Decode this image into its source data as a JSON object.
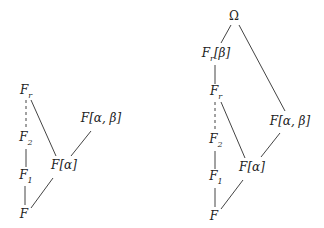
{
  "diagrams": [
    {
      "name": "left-lattice",
      "nodes": [
        {
          "id": "Fr",
          "base": "F",
          "sub": "r",
          "suffix": "",
          "x": 26,
          "y": 92
        },
        {
          "id": "F2",
          "base": "F",
          "sub": "2",
          "suffix": "",
          "x": 26,
          "y": 139
        },
        {
          "id": "F1",
          "base": "F",
          "sub": "1",
          "suffix": "",
          "x": 26,
          "y": 177
        },
        {
          "id": "F",
          "base": "F",
          "sub": "",
          "suffix": "",
          "x": 24,
          "y": 214
        },
        {
          "id": "Fa",
          "base": "F",
          "sub": "",
          "suffix": "[α]",
          "x": 64,
          "y": 165
        },
        {
          "id": "Fab",
          "base": "F",
          "sub": "",
          "suffix": "[α, β]",
          "x": 101,
          "y": 118
        }
      ],
      "edges": [
        {
          "from": "Fr",
          "to": "F2",
          "style": "dashed"
        },
        {
          "from": "F2",
          "to": "F1",
          "style": "solid"
        },
        {
          "from": "F1",
          "to": "F",
          "style": "solid"
        },
        {
          "from": "Fr",
          "to": "Fa",
          "style": "solid"
        },
        {
          "from": "F",
          "to": "Fa",
          "style": "solid"
        },
        {
          "from": "Fa",
          "to": "Fab",
          "style": "solid"
        }
      ]
    },
    {
      "name": "right-lattice",
      "nodes": [
        {
          "id": "Omega",
          "base": "Ω",
          "sub": "",
          "suffix": "",
          "x": 234,
          "y": 16
        },
        {
          "id": "Frb",
          "base": "F",
          "sub": "r",
          "suffix": "[β]",
          "x": 216,
          "y": 55
        },
        {
          "id": "Fr",
          "base": "F",
          "sub": "r",
          "suffix": "",
          "x": 216,
          "y": 93
        },
        {
          "id": "F2",
          "base": "F",
          "sub": "2",
          "suffix": "",
          "x": 216,
          "y": 141
        },
        {
          "id": "F1",
          "base": "F",
          "sub": "1",
          "suffix": "",
          "x": 216,
          "y": 178
        },
        {
          "id": "F",
          "base": "F",
          "sub": "",
          "suffix": "",
          "x": 214,
          "y": 216
        },
        {
          "id": "Fa",
          "base": "F",
          "sub": "",
          "suffix": "[α]",
          "x": 252,
          "y": 167
        },
        {
          "id": "Fab",
          "base": "F",
          "sub": "",
          "suffix": "[α, β]",
          "x": 290,
          "y": 121
        }
      ],
      "edges": [
        {
          "from": "Omega",
          "to": "Frb",
          "style": "solid"
        },
        {
          "from": "Omega",
          "to": "Fab",
          "style": "solid"
        },
        {
          "from": "Frb",
          "to": "Fr",
          "style": "solid"
        },
        {
          "from": "Fr",
          "to": "F2",
          "style": "dashed"
        },
        {
          "from": "F2",
          "to": "F1",
          "style": "solid"
        },
        {
          "from": "F1",
          "to": "F",
          "style": "solid"
        },
        {
          "from": "Fr",
          "to": "Fa",
          "style": "solid"
        },
        {
          "from": "F",
          "to": "Fa",
          "style": "solid"
        },
        {
          "from": "Fa",
          "to": "Fab",
          "style": "solid"
        }
      ]
    }
  ]
}
